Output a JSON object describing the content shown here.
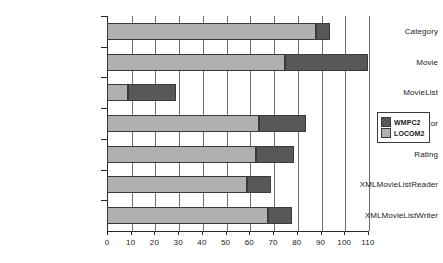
{
  "chart_data": {
    "type": "bar",
    "orientation": "horizontal",
    "stacked": true,
    "title": "",
    "xlabel": "",
    "ylabel": "",
    "xlim": [
      0,
      110
    ],
    "xticks": [
      0,
      10,
      20,
      30,
      40,
      50,
      60,
      70,
      80,
      90,
      100,
      110
    ],
    "grid": true,
    "grid_axis": "x",
    "legend_position": "right",
    "categories": [
      "Category",
      "Movie",
      "MovieList",
      "MovieListEditor",
      "Rating",
      "XMLMovieListReader",
      "XMLMovieListWriter"
    ],
    "series": [
      {
        "name": "LOCOM2",
        "color": "#b0b0b0",
        "values": [
          88,
          75,
          9,
          64,
          63,
          59,
          68
        ]
      },
      {
        "name": "WMPC2",
        "color": "#585858",
        "values": [
          6,
          35,
          20,
          20,
          16,
          10,
          10
        ]
      }
    ],
    "totals": [
      94,
      110,
      29,
      84,
      79,
      69,
      78
    ]
  },
  "legend": {
    "entries": [
      {
        "label": "WMPC2",
        "color": "#585858"
      },
      {
        "label": "LOCOM2",
        "color": "#b0b0b0"
      }
    ]
  },
  "colors": {
    "locom2": "#b0b0b0",
    "wmpc2": "#585858",
    "axis": "#2b2b2b",
    "grid": "#6d6d6d",
    "background": "#ffffff"
  }
}
